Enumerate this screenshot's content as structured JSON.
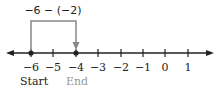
{
  "expression": "−6 − (−2)",
  "number_line": {
    "ticks": [
      "−6",
      "−5",
      "−4",
      "−3",
      "−2",
      "−1",
      "0",
      "1"
    ],
    "start": {
      "value": -6,
      "label": "Start"
    },
    "end": {
      "value": -4,
      "label": "End"
    }
  },
  "colors": {
    "line": "#222222",
    "bracket": "#888888",
    "end_label": "#999999"
  }
}
